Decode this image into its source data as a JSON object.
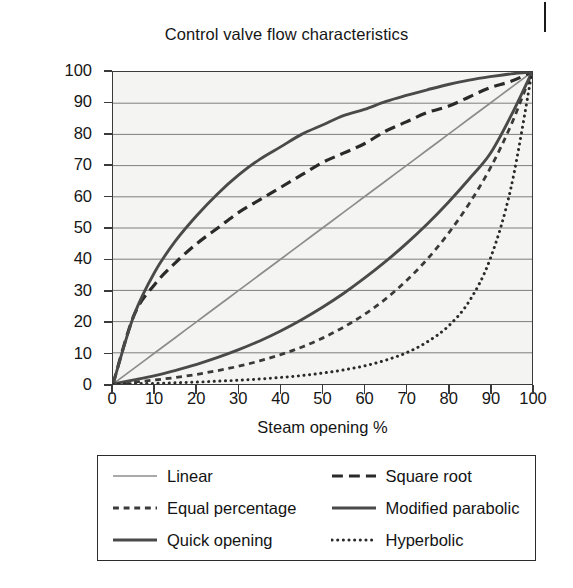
{
  "chart_data": {
    "type": "line",
    "title": "Control valve flow characteristics",
    "xlabel": "Steam opening %",
    "ylabel": "Flow %",
    "xlim": [
      0,
      100
    ],
    "ylim": [
      0,
      100
    ],
    "grid": true,
    "grid_axis": "y",
    "legend_position": "below",
    "x": [
      0,
      5,
      10,
      15,
      20,
      25,
      30,
      35,
      40,
      45,
      50,
      55,
      60,
      65,
      70,
      75,
      80,
      85,
      90,
      95,
      100
    ],
    "xticks": [
      0,
      10,
      20,
      30,
      40,
      50,
      60,
      70,
      80,
      90,
      100
    ],
    "yticks": [
      0,
      10,
      20,
      30,
      40,
      50,
      60,
      70,
      80,
      90,
      100
    ],
    "series": [
      {
        "name": "Linear",
        "style": "solid",
        "color": "#8c8c8c",
        "width": 1.7,
        "values": [
          0,
          5,
          10,
          15,
          20,
          25,
          30,
          35,
          40,
          45,
          50,
          55,
          60,
          65,
          70,
          75,
          80,
          85,
          90,
          95,
          100
        ]
      },
      {
        "name": "Square root",
        "style": "dashed",
        "color": "#2a2a2a",
        "width": 3.2,
        "values": [
          0,
          22,
          32,
          39,
          45,
          50,
          55,
          59,
          63,
          67,
          71,
          74,
          77,
          81,
          84,
          87,
          89,
          92,
          95,
          97,
          100
        ]
      },
      {
        "name": "Equal percentage",
        "style": "short-dashed",
        "color": "#3a3a3a",
        "width": 2.8,
        "values": [
          0,
          0.6,
          1.3,
          2.1,
          3.1,
          4.3,
          5.7,
          7.4,
          9.4,
          11.8,
          14.7,
          18.2,
          22.3,
          27.2,
          33.1,
          40.0,
          48.2,
          57.8,
          69.1,
          83.0,
          100
        ]
      },
      {
        "name": "Modified parabolic",
        "style": "solid",
        "color": "#4a4a4a",
        "width": 2.9,
        "values": [
          0,
          1.3,
          2.7,
          4.4,
          6.3,
          8.5,
          11.0,
          13.8,
          17.0,
          20.6,
          24.6,
          29.0,
          33.9,
          39.2,
          45.0,
          51.3,
          58.2,
          65.7,
          73.8,
          86.0,
          100
        ]
      },
      {
        "name": "Quick opening",
        "style": "solid",
        "color": "#4a4a4a",
        "width": 2.9,
        "values": [
          0,
          22,
          36,
          46,
          54,
          61,
          67,
          72,
          76,
          80,
          83,
          86,
          88,
          90.5,
          92.5,
          94.3,
          96,
          97.4,
          98.5,
          99.4,
          100
        ]
      },
      {
        "name": "Hyperbolic",
        "style": "dotted",
        "color": "#2a2a2a",
        "width": 3.0,
        "values": [
          0,
          0.1,
          0.2,
          0.4,
          0.6,
          0.9,
          1.2,
          1.6,
          2.1,
          2.7,
          3.5,
          4.5,
          5.8,
          7.6,
          10.0,
          13.5,
          18.5,
          26.5,
          40.0,
          63.0,
          100
        ]
      }
    ]
  },
  "legend": {
    "items": [
      {
        "label": "Linear"
      },
      {
        "label": "Square root"
      },
      {
        "label": "Equal percentage"
      },
      {
        "label": "Modified parabolic"
      },
      {
        "label": "Quick opening"
      },
      {
        "label": "Hyperbolic"
      }
    ],
    "order": [
      0,
      1,
      2,
      3,
      4,
      5
    ]
  }
}
